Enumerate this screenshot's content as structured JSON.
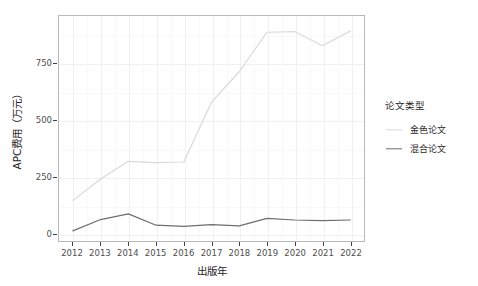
{
  "chart_data": {
    "type": "line",
    "title": "",
    "xlabel": "出版年",
    "ylabel": "APC费用（万元）",
    "x": [
      2012,
      2013,
      2014,
      2015,
      2016,
      2017,
      2018,
      2019,
      2020,
      2021,
      2022
    ],
    "xticklabels": [
      "2012",
      "2013",
      "2014",
      "2015",
      "2016",
      "2017",
      "2018",
      "2019",
      "2020",
      "2021",
      "2022"
    ],
    "yticklabels": [
      "0",
      "250",
      "500",
      "750"
    ],
    "yticks": [
      0,
      250,
      500,
      750
    ],
    "ylim": [
      -35,
      962
    ],
    "xlim": [
      2011.5,
      2022.5
    ],
    "grid": true,
    "legend_position": "right",
    "legend_title": "论文类型",
    "series": [
      {
        "name": "金色论文",
        "color": "#d9d9d9",
        "values": [
          144,
          240,
          318,
          312,
          315,
          580,
          715,
          890,
          893,
          830,
          895
        ]
      },
      {
        "name": "混合论文",
        "color": "#6e6e6e",
        "values": [
          10,
          60,
          85,
          35,
          30,
          38,
          32,
          65,
          58,
          55,
          58
        ]
      }
    ]
  },
  "legend": {
    "title": "论文类型",
    "items": [
      {
        "label": "金色论文",
        "color": "#d9d9d9"
      },
      {
        "label": "混合论文",
        "color": "#6e6e6e"
      }
    ]
  },
  "axes": {
    "x_title": "出版年",
    "y_title": "APC费用（万元）"
  },
  "colors": {
    "panel_border": "#b9b9b9",
    "grid_major": "#f0f0f0",
    "grid_minor": "#f8f8f8",
    "tick_text": "#4d4d4d",
    "axis_title_text": "#262626",
    "gold_series": "#d9d9d9",
    "hybrid_series": "#6e6e6e",
    "background": "#ffffff"
  }
}
